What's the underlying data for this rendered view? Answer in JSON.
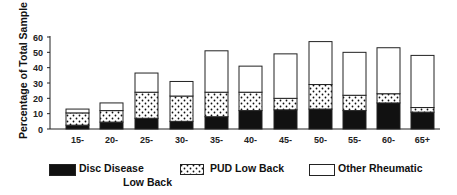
{
  "chart_data": {
    "type": "bar",
    "stacked": true,
    "title": "",
    "xlabel": "",
    "ylabel": "Percentage of Total Sample",
    "ylim": [
      0,
      60
    ],
    "yticks": [
      0,
      10,
      20,
      30,
      40,
      50,
      60
    ],
    "grid": false,
    "legend_position": "bottom",
    "categories": [
      "15-",
      "20-",
      "25-",
      "30-",
      "35-",
      "40-",
      "45-",
      "50-",
      "55-",
      "60-",
      "65+"
    ],
    "series": [
      {
        "name": "Disc Disease Low Back",
        "pattern": "solid-black",
        "values": [
          2.5,
          4.5,
          7,
          5,
          8,
          12,
          12.5,
          13,
          12,
          17,
          11
        ]
      },
      {
        "name": "PUD Low Back",
        "pattern": "dotted",
        "values": [
          8,
          7.5,
          17,
          16.5,
          16,
          12,
          7.5,
          16,
          10,
          6,
          3
        ]
      },
      {
        "name": "Other Rheumatic",
        "pattern": "white",
        "values": [
          2.5,
          5,
          12.5,
          9.5,
          27,
          17,
          29,
          28,
          28,
          30,
          34
        ]
      }
    ],
    "totals": [
      13,
      17,
      36.5,
      31,
      51,
      41,
      49,
      57,
      50,
      53,
      48
    ]
  },
  "legend": {
    "disc": {
      "line1": "Disc Disease",
      "line2": "Low Back"
    },
    "pud": "PUD Low Back",
    "other": "Other Rheumatic"
  }
}
